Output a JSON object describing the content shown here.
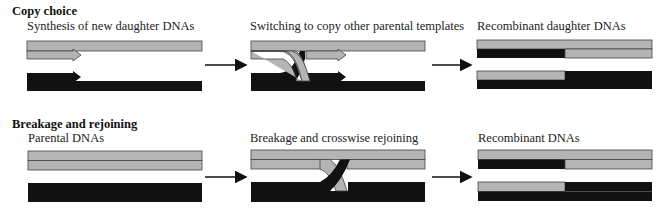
{
  "cropped_top_text": "...y... g ... p...",
  "colors": {
    "parental_gray": "#b4b4b4",
    "strand_black": "#111111",
    "outline": "#444444",
    "arrow": "#111111"
  },
  "sections": [
    {
      "title": "Copy choice",
      "panels": [
        {
          "label": "Synthesis of new daughter DNAs"
        },
        {
          "label": "Switching to copy other parental templates"
        },
        {
          "label": "Recombinant daughter DNAs"
        }
      ]
    },
    {
      "title": "Breakage and rejoining",
      "panels": [
        {
          "label": "Parental DNAs"
        },
        {
          "label": "Breakage and crosswise rejoining"
        },
        {
          "label": "Recombinant DNAs"
        }
      ]
    }
  ]
}
